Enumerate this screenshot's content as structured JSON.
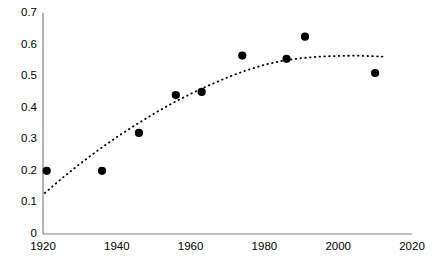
{
  "chart_data": {
    "type": "scatter",
    "title": "",
    "xlabel": "",
    "ylabel": "",
    "xlim": [
      1920,
      2020
    ],
    "ylim": [
      0,
      0.7
    ],
    "grid": false,
    "legend": false,
    "x_ticks": [
      1920,
      1940,
      1960,
      1980,
      2000,
      2020
    ],
    "x_tick_labels": [
      "1920",
      "1940",
      "1960",
      "1980",
      "2000",
      "2020"
    ],
    "y_ticks": [
      0,
      0.1,
      0.2,
      0.3,
      0.4,
      0.5,
      0.6,
      0.7
    ],
    "y_tick_labels": [
      "0",
      "0.1",
      "0.2",
      "0.3",
      "0.4",
      "0.5",
      "0.6",
      "0.7"
    ],
    "series": [
      {
        "name": "observations",
        "type": "scatter",
        "marker": "filled-circle",
        "color": "#000000",
        "points": [
          {
            "x": 1921,
            "y": 0.2
          },
          {
            "x": 1936,
            "y": 0.2
          },
          {
            "x": 1946,
            "y": 0.32
          },
          {
            "x": 1956,
            "y": 0.44
          },
          {
            "x": 1963,
            "y": 0.45
          },
          {
            "x": 1974,
            "y": 0.565
          },
          {
            "x": 1986,
            "y": 0.555
          },
          {
            "x": 1991,
            "y": 0.625
          },
          {
            "x": 2010,
            "y": 0.51
          }
        ]
      },
      {
        "name": "trend-line",
        "type": "line",
        "style": "dotted",
        "color": "#000000",
        "points": [
          {
            "x": 1920.5,
            "y": 0.13
          },
          {
            "x": 1925,
            "y": 0.175
          },
          {
            "x": 1930,
            "y": 0.222
          },
          {
            "x": 1935,
            "y": 0.266
          },
          {
            "x": 1940,
            "y": 0.307
          },
          {
            "x": 1945,
            "y": 0.345
          },
          {
            "x": 1950,
            "y": 0.381
          },
          {
            "x": 1955,
            "y": 0.414
          },
          {
            "x": 1960,
            "y": 0.444
          },
          {
            "x": 1965,
            "y": 0.471
          },
          {
            "x": 1970,
            "y": 0.496
          },
          {
            "x": 1975,
            "y": 0.518
          },
          {
            "x": 1980,
            "y": 0.536
          },
          {
            "x": 1985,
            "y": 0.549
          },
          {
            "x": 1990,
            "y": 0.557
          },
          {
            "x": 1995,
            "y": 0.562
          },
          {
            "x": 2000,
            "y": 0.564
          },
          {
            "x": 2005,
            "y": 0.565
          },
          {
            "x": 2012,
            "y": 0.562
          }
        ]
      }
    ]
  },
  "axes": {
    "y_axis_name": "value-axis",
    "x_axis_name": "year-axis"
  }
}
